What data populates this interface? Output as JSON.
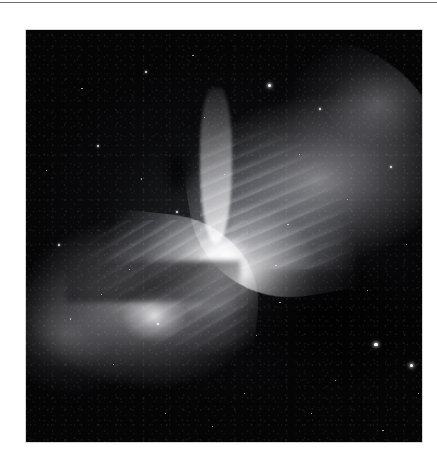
{
  "page": {
    "background_color": "#ffffff",
    "rule_color": "#6f6f6f",
    "alt_text": ""
  },
  "figure": {
    "name": "bipolar-butterfly-nebula-photograph",
    "caption": "",
    "type": "grayscale astronomical photograph",
    "plate": {
      "x": 26,
      "y": 30,
      "width": 396,
      "height": 412,
      "background_color": "#050506",
      "border_color": "#b9b9b9"
    },
    "tonal_range": {
      "darkest": "#030304",
      "midtone": "#6e6e74",
      "brightest": "#eeeef0"
    },
    "features": [
      {
        "id": "lobe-upper-right",
        "label": "upper-right nebula lobe",
        "description": "broad filamentary fan sweeping toward the upper right corner"
      },
      {
        "id": "lobe-lower-left",
        "label": "lower-left nebula lobe",
        "description": "rounded fan of glowing gas with bright knots"
      },
      {
        "id": "waist",
        "label": "pinched central waist",
        "description": "brightest compact region where the two lobes meet"
      },
      {
        "id": "dust-lane",
        "label": "dark dust lane",
        "description": "dark diagonal band crossing the lower-left lobe"
      },
      {
        "id": "dark-notch",
        "label": "dark notch",
        "description": "dark obscuring patch along the upper spine"
      },
      {
        "id": "star-field",
        "label": "background star field",
        "description": "scattered foreground and background stars"
      }
    ],
    "stars": [
      {
        "x": 0.61,
        "y": 0.13,
        "size": "lg"
      },
      {
        "x": 0.88,
        "y": 0.76,
        "size": "lg"
      },
      {
        "x": 0.97,
        "y": 0.81,
        "size": "lg"
      },
      {
        "x": 0.18,
        "y": 0.28,
        "size": "md"
      },
      {
        "x": 0.3,
        "y": 0.1,
        "size": "md"
      },
      {
        "x": 0.42,
        "y": 0.06,
        "size": "sm"
      },
      {
        "x": 0.08,
        "y": 0.52,
        "size": "md"
      },
      {
        "x": 0.11,
        "y": 0.7,
        "size": "sm"
      },
      {
        "x": 0.22,
        "y": 0.81,
        "size": "sm"
      },
      {
        "x": 0.26,
        "y": 0.58,
        "size": "sm"
      },
      {
        "x": 0.35,
        "y": 0.93,
        "size": "sm"
      },
      {
        "x": 0.47,
        "y": 0.96,
        "size": "sm"
      },
      {
        "x": 0.55,
        "y": 0.88,
        "size": "sm"
      },
      {
        "x": 0.69,
        "y": 0.3,
        "size": "sm"
      },
      {
        "x": 0.74,
        "y": 0.19,
        "size": "md"
      },
      {
        "x": 0.81,
        "y": 0.41,
        "size": "sm"
      },
      {
        "x": 0.92,
        "y": 0.33,
        "size": "md"
      },
      {
        "x": 0.96,
        "y": 0.52,
        "size": "sm"
      },
      {
        "x": 0.99,
        "y": 0.88,
        "size": "sm"
      },
      {
        "x": 0.64,
        "y": 0.66,
        "size": "sm"
      },
      {
        "x": 0.58,
        "y": 0.74,
        "size": "sm"
      },
      {
        "x": 0.72,
        "y": 0.93,
        "size": "sm"
      },
      {
        "x": 0.86,
        "y": 0.63,
        "size": "sm"
      },
      {
        "x": 0.45,
        "y": 0.21,
        "size": "sm"
      },
      {
        "x": 0.38,
        "y": 0.44,
        "size": "md"
      },
      {
        "x": 0.29,
        "y": 0.36,
        "size": "sm"
      },
      {
        "x": 0.14,
        "y": 0.14,
        "size": "sm"
      },
      {
        "x": 0.05,
        "y": 0.34,
        "size": "sm"
      },
      {
        "x": 0.5,
        "y": 0.35,
        "size": "sm"
      },
      {
        "x": 0.66,
        "y": 0.47,
        "size": "sm"
      },
      {
        "x": 0.33,
        "y": 0.71,
        "size": "md"
      },
      {
        "x": 0.19,
        "y": 0.64,
        "size": "sm"
      },
      {
        "x": 0.9,
        "y": 0.97,
        "size": "sm"
      },
      {
        "x": 0.78,
        "y": 0.85,
        "size": "sm"
      },
      {
        "x": 0.63,
        "y": 0.57,
        "size": "sm"
      }
    ]
  }
}
